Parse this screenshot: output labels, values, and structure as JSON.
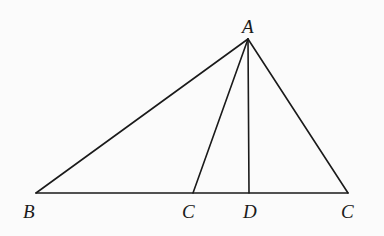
{
  "diagram": {
    "type": "triangle-with-cevians",
    "points": {
      "A": {
        "x": 248,
        "y": 39
      },
      "B": {
        "x": 36,
        "y": 193
      },
      "C1": {
        "x": 193,
        "y": 193
      },
      "D": {
        "x": 249,
        "y": 193
      },
      "C2": {
        "x": 348,
        "y": 193
      }
    },
    "segments": [
      {
        "name": "AB",
        "from": "A",
        "to": "B"
      },
      {
        "name": "AC1",
        "from": "A",
        "to": "C1"
      },
      {
        "name": "AD",
        "from": "A",
        "to": "D"
      },
      {
        "name": "AC2",
        "from": "A",
        "to": "C2"
      },
      {
        "name": "BC2",
        "from": "B",
        "to": "C2"
      }
    ],
    "labels": [
      {
        "id": "A",
        "text": "A",
        "x": 242,
        "y": 33
      },
      {
        "id": "B",
        "text": "B",
        "x": 23,
        "y": 218
      },
      {
        "id": "C1",
        "text": "C",
        "x": 182,
        "y": 218
      },
      {
        "id": "D",
        "text": "D",
        "x": 243,
        "y": 218
      },
      {
        "id": "C2",
        "text": "C",
        "x": 341,
        "y": 218
      }
    ]
  }
}
